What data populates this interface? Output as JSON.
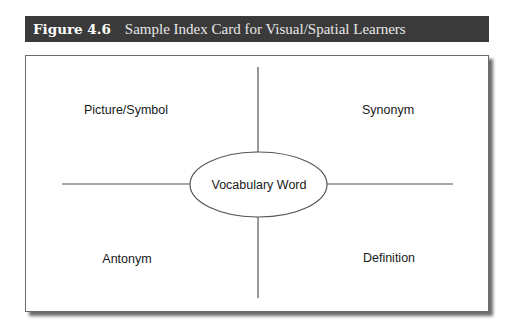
{
  "figure": {
    "number": "Figure 4.6",
    "title": "Sample Index Card for Visual/Spatial Learners",
    "header_bg": "#3a3a3a"
  },
  "card": {
    "center": "Vocabulary Word",
    "quadrants": {
      "top_left": "Picture/Symbol",
      "top_right": "Synonym",
      "bottom_left": "Antonym",
      "bottom_right": "Definition"
    }
  }
}
